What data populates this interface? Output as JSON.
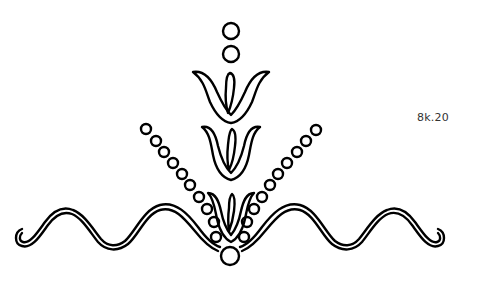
{
  "figure": {
    "label": "8k.20",
    "stroke_color": "#000000",
    "background": "#ffffff",
    "elements": {
      "top_dots": [
        {
          "cx": 231,
          "cy": 31,
          "r": 8
        },
        {
          "cx": 231,
          "cy": 54,
          "r": 8
        }
      ],
      "tulips": [
        "upper-tulip",
        "middle-tulip",
        "lower-tulip"
      ],
      "dot_chains": [
        "left-dot-chain",
        "right-dot-chain"
      ],
      "base_dot": {
        "cx": 230,
        "cy": 256,
        "r": 9
      },
      "waves": [
        "left-wave",
        "right-wave"
      ]
    }
  }
}
